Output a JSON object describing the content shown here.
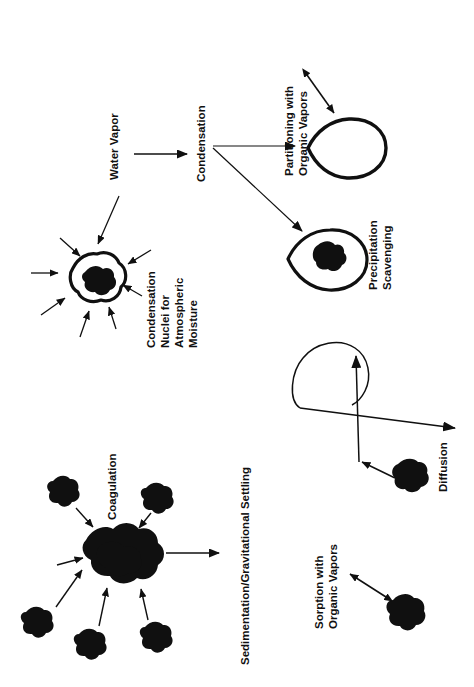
{
  "figure": {
    "orientation": "rotated-90-ccw",
    "background_color": "#ffffff",
    "ink_color": "#101010",
    "width": 474,
    "height": 687
  },
  "labels": {
    "water_vapor": "Water Vapor",
    "condensation": "Condensation",
    "partitioning_line1": "Partitioning with",
    "partitioning_line2": "Organic Vapors",
    "precipitation_line1": "Precipitation",
    "precipitation_line2": "Scavenging",
    "nuclei_line1": "Condensation",
    "nuclei_line2": "Nuclei for",
    "nuclei_line3": "Atmospheric",
    "nuclei_line4": "Moisture",
    "coagulation": "Coagulation",
    "sedimentation": "Sedimentation/Gravitational Settling",
    "sorption_line1": "Sorption with",
    "sorption_line2": "Organic Vapors",
    "diffusion": "Diffusion"
  },
  "processes": [
    {
      "name": "water-vapor",
      "label": "Water Vapor"
    },
    {
      "name": "condensation",
      "label": "Condensation"
    },
    {
      "name": "partitioning-with-organic-vapors",
      "label": "Partitioning with Organic Vapors"
    },
    {
      "name": "precipitation-scavenging",
      "label": "Precipitation Scavenging"
    },
    {
      "name": "condensation-nuclei",
      "label": "Condensation Nuclei for Atmospheric Moisture"
    },
    {
      "name": "coagulation",
      "label": "Coagulation"
    },
    {
      "name": "sedimentation-gravitational-settling",
      "label": "Sedimentation/Gravitational Settling"
    },
    {
      "name": "sorption-with-organic-vapors",
      "label": "Sorption with Organic Vapors"
    },
    {
      "name": "diffusion",
      "label": "Diffusion"
    }
  ],
  "counts": {
    "condensation_nuclei_arrows": 8,
    "coagulation_incoming_particles": 6
  }
}
